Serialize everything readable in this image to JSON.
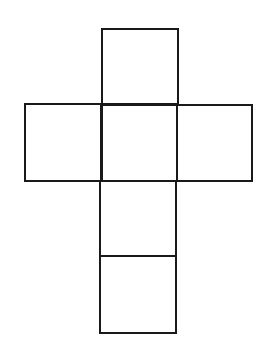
{
  "diagram": {
    "type": "cube-net",
    "stroke_color": "#1a1a1a",
    "background": "#ffffff",
    "faces": [
      {
        "name": "top",
        "x": 102,
        "y": 29,
        "w": 76,
        "h": 76
      },
      {
        "name": "left",
        "x": 25,
        "y": 104,
        "w": 77,
        "h": 77
      },
      {
        "name": "center",
        "x": 101,
        "y": 104,
        "w": 76,
        "h": 77
      },
      {
        "name": "right",
        "x": 177,
        "y": 105,
        "w": 75,
        "h": 76
      },
      {
        "name": "lower-middle",
        "x": 100,
        "y": 181,
        "w": 76,
        "h": 75
      },
      {
        "name": "bottom",
        "x": 100,
        "y": 256,
        "w": 76,
        "h": 77
      }
    ]
  }
}
